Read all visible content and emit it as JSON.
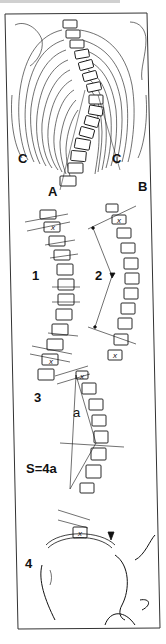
{
  "figure": {
    "type": "medical-illustration",
    "panel_labels": {
      "c_left": "C",
      "c_right": "C",
      "a": "A",
      "b": "B",
      "p1": "1",
      "p2": "2",
      "p3": "3",
      "p3_formula": "S=4a",
      "p3_a": "a",
      "p4": "4"
    },
    "vertebra_marker": "x",
    "colors": {
      "ink": "#111111",
      "paper": "#ffffff",
      "frame": "#333333"
    }
  }
}
